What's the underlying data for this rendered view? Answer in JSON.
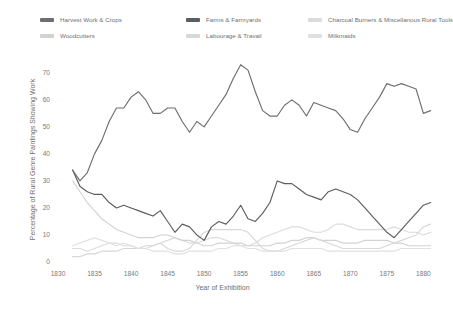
{
  "legend": {
    "items": [
      {
        "label": "Harvest Work & Crops",
        "color": "#6e6e6e",
        "swatch": "legend-swatch-harvest"
      },
      {
        "label": "Woodcutters",
        "color": "#d2d2d2",
        "swatch": "legend-swatch-woodcutters"
      },
      {
        "label": "Farms & Farmyards",
        "color": "#5d5d5d",
        "swatch": "legend-swatch-farms"
      },
      {
        "label": "Labourage & Travail",
        "color": "#d8d8d8",
        "swatch": "legend-swatch-labourage"
      },
      {
        "label": "Charcoal Burners & Miscellanous Rural Tools",
        "color": "#dcdcdc",
        "swatch": "legend-swatch-charcoal"
      },
      {
        "label": "Milkmaids",
        "color": "#e0e0e0",
        "swatch": "legend-swatch-milkmaids"
      }
    ]
  },
  "axes": {
    "x_title": "Year of Exhibition",
    "y_title": "Percentage of Rural Genre Paintings Showing Work",
    "x_ticks": [
      "1830",
      "1835",
      "1840",
      "1845",
      "1850",
      "1855",
      "1860",
      "1865",
      "1870",
      "1875",
      "1880"
    ],
    "y_ticks": [
      "0",
      "10",
      "20",
      "30",
      "40",
      "50",
      "60",
      "70"
    ]
  },
  "chart_data": {
    "type": "line",
    "title": "",
    "xlabel": "Year of Exhibition",
    "ylabel": "Percentage of Rural Genre Paintings Showing Work",
    "xlim": [
      1830,
      1882
    ],
    "ylim": [
      0,
      74
    ],
    "grid": false,
    "legend_position": "top",
    "x": [
      1832,
      1833,
      1834,
      1835,
      1836,
      1837,
      1838,
      1839,
      1840,
      1841,
      1842,
      1843,
      1844,
      1845,
      1846,
      1847,
      1848,
      1849,
      1850,
      1851,
      1852,
      1853,
      1854,
      1855,
      1856,
      1857,
      1858,
      1859,
      1860,
      1861,
      1862,
      1863,
      1864,
      1865,
      1866,
      1867,
      1868,
      1869,
      1870,
      1871,
      1872,
      1873,
      1874,
      1875,
      1876,
      1877,
      1878,
      1879,
      1880,
      1881
    ],
    "series": [
      {
        "name": "Harvest Work & Crops",
        "color": "#6e6e6e",
        "values": [
          34,
          30,
          33,
          40,
          45,
          52,
          57,
          57,
          61,
          63,
          60,
          55,
          55,
          57,
          57,
          52,
          48,
          52,
          50,
          54,
          58,
          62,
          68,
          73,
          71,
          63,
          56,
          54,
          54,
          58,
          60,
          58,
          54,
          59,
          58,
          57,
          56,
          53,
          49,
          48,
          53,
          57,
          61,
          66,
          65,
          66,
          65,
          64,
          55,
          56
        ]
      },
      {
        "name": "Farms & Farmyards",
        "color": "#5d5d5d",
        "values": [
          34,
          28,
          26,
          25,
          25,
          22,
          20,
          21,
          20,
          19,
          18,
          17,
          19,
          15,
          11,
          14,
          13,
          10,
          8,
          13,
          15,
          14,
          17,
          21,
          16,
          15,
          18,
          22,
          30,
          29,
          29,
          27,
          25,
          24,
          23,
          26,
          27,
          26,
          25,
          23,
          20,
          17,
          14,
          11,
          9,
          12,
          15,
          18,
          21,
          22
        ]
      },
      {
        "name": "Charcoal Burners & Miscellanous Rural Tools",
        "color": "#dcdcdc",
        "values": [
          5,
          5,
          4,
          5,
          6,
          7,
          7,
          6,
          6,
          5,
          5,
          6,
          7,
          8,
          9,
          8,
          7,
          7,
          8,
          9,
          9,
          8,
          7,
          6,
          6,
          7,
          9,
          10,
          11,
          12,
          13,
          13,
          12,
          11,
          11,
          12,
          14,
          14,
          13,
          12,
          12,
          12,
          12,
          12,
          13,
          12,
          11,
          11,
          10,
          11
        ]
      },
      {
        "name": "Woodcutters",
        "color": "#d2d2d2",
        "values": [
          30,
          26,
          22,
          19,
          16,
          14,
          12,
          11,
          10,
          9,
          9,
          9,
          10,
          10,
          9,
          8,
          8,
          7,
          6,
          6,
          7,
          7,
          7,
          7,
          6,
          6,
          6,
          6,
          7,
          7,
          8,
          8,
          9,
          9,
          8,
          8,
          8,
          7,
          7,
          7,
          8,
          8,
          8,
          8,
          7,
          7,
          6,
          6,
          6,
          6
        ]
      },
      {
        "name": "Labourage & Travail",
        "color": "#d8d8d8",
        "values": [
          2,
          2,
          3,
          3,
          4,
          4,
          4,
          5,
          5,
          5,
          6,
          6,
          7,
          5,
          4,
          4,
          5,
          8,
          11,
          12,
          12,
          12,
          12,
          12,
          11,
          8,
          5,
          4,
          4,
          5,
          6,
          7,
          8,
          9,
          8,
          7,
          6,
          5,
          5,
          5,
          5,
          5,
          5,
          6,
          7,
          8,
          9,
          10,
          13,
          14
        ]
      },
      {
        "name": "Milkmaids",
        "color": "#e0e0e0",
        "values": [
          6,
          7,
          8,
          9,
          8,
          7,
          6,
          7,
          6,
          5,
          5,
          4,
          4,
          4,
          3,
          3,
          4,
          4,
          4,
          4,
          5,
          5,
          6,
          6,
          5,
          5,
          4,
          4,
          4,
          4,
          5,
          5,
          5,
          5,
          5,
          4,
          4,
          4,
          4,
          4,
          4,
          4,
          4,
          4,
          4,
          5,
          5,
          5,
          5,
          5
        ]
      }
    ]
  }
}
